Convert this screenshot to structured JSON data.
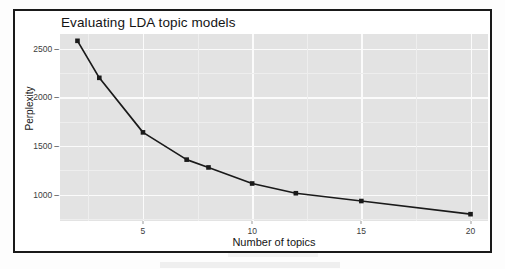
{
  "figure": {
    "title": "Evaluating LDA topic models",
    "subtitle": "Optimal number of topics (smaller is better)"
  },
  "chart_data": {
    "type": "line",
    "title": "Evaluating LDA topic models",
    "subtitle": "Optimal number of topics (smaller is better)",
    "xlabel": "Number of topics",
    "ylabel": "Perplexity",
    "x": [
      2,
      3,
      5,
      7,
      8,
      10,
      12,
      15,
      20
    ],
    "values": [
      2580,
      2200,
      1640,
      1360,
      1280,
      1115,
      1015,
      935,
      800
    ],
    "series": [
      {
        "name": "Perplexity",
        "x": [
          2,
          3,
          5,
          7,
          8,
          10,
          12,
          15,
          20
        ],
        "values": [
          2580,
          2200,
          1640,
          1360,
          1280,
          1115,
          1015,
          935,
          800
        ]
      }
    ],
    "xlim": [
      1.2,
      20.8
    ],
    "ylim": [
      730,
      2650
    ],
    "xticks": [
      5,
      10,
      15,
      20
    ],
    "xticklabels": [
      "5",
      "10",
      "15",
      "20"
    ],
    "yticks": [
      1000,
      1500,
      2000,
      2500
    ],
    "yticklabels": [
      "1000",
      "1500",
      "2000",
      "2500"
    ],
    "grid": true,
    "grid_major_color": "#ffffff",
    "grid_minor_color": "#eeeeee",
    "panel_color": "#e3e3e3",
    "line_color": "#1a1a1a",
    "point_color": "#1a1a1a",
    "marker": "square",
    "legend": null,
    "legend_position": "none"
  },
  "axes": {
    "y_label": "Perplexity",
    "x_label": "Number of topics",
    "y_tick_labels": [
      "2500",
      "2000",
      "1500",
      "1000"
    ],
    "x_tick_labels": [
      "5",
      "10",
      "15",
      "20"
    ],
    "tick_dash": "–"
  }
}
